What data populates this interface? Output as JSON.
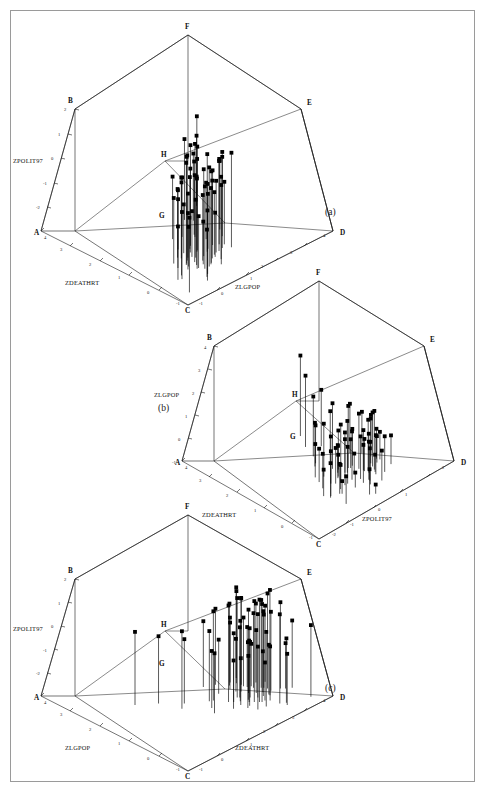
{
  "figure": {
    "border_color": "#9a9a9a",
    "background": "#ffffff",
    "caption_fragment": ""
  },
  "panels": [
    {
      "tag": "(a)",
      "corners": [
        "A",
        "B",
        "C",
        "D",
        "E",
        "F",
        "G",
        "H"
      ],
      "vertical_axis": {
        "title": "ZPOLIT97",
        "ticks": [
          "2",
          "1",
          "0",
          "-1",
          "-2"
        ]
      },
      "left_axis": {
        "title": "ZDEATHRT",
        "ticks": [
          "4",
          "3",
          "2",
          "1",
          "0",
          "-1"
        ]
      },
      "right_axis": {
        "title": "ZLGPOP",
        "ticks": [
          "-1",
          "0",
          "1",
          "2",
          "3",
          "4"
        ]
      }
    },
    {
      "tag": "(b)",
      "corners": [
        "A",
        "B",
        "C",
        "D",
        "E",
        "F",
        "G",
        "H"
      ],
      "vertical_axis": {
        "title": "ZLGPOP",
        "ticks": [
          "4",
          "3",
          "2",
          "1",
          "0",
          "-1"
        ]
      },
      "left_axis": {
        "title": "ZDEATHRT",
        "ticks": [
          "4",
          "3",
          "2",
          "1",
          "0",
          "-1"
        ]
      },
      "right_axis": {
        "title": "ZPOLIT97",
        "ticks": [
          "-2",
          "-1",
          "0",
          "1",
          "2"
        ]
      }
    },
    {
      "tag": "(c)",
      "corners": [
        "A",
        "B",
        "C",
        "D",
        "E",
        "F",
        "G",
        "H"
      ],
      "vertical_axis": {
        "title": "ZPOLIT97",
        "ticks": [
          "2",
          "1",
          "0",
          "-1",
          "-2"
        ]
      },
      "left_axis": {
        "title": "ZLGPOP",
        "ticks": [
          "4",
          "3",
          "2",
          "1",
          "0",
          "-1"
        ]
      },
      "right_axis": {
        "title": "ZDEATHRT",
        "ticks": [
          "4",
          "3",
          "2",
          "1",
          "0",
          "-1"
        ]
      }
    }
  ],
  "chart_data": {
    "type": "scatter",
    "title": "",
    "variables": [
      "ZDEATHRT",
      "ZLGPOP",
      "ZPOLIT97"
    ],
    "axis_ranges": {
      "ZDEATHRT": [
        -1,
        4
      ],
      "ZLGPOP": [
        -1,
        4
      ],
      "ZPOLIT97": [
        -2,
        2
      ]
    },
    "grid": false,
    "legend": null,
    "n_points": 62,
    "points": [
      [
        -0.55,
        -0.6,
        0.45
      ],
      [
        0.1,
        -0.35,
        0.2
      ],
      [
        -0.2,
        0.3,
        0.95
      ],
      [
        0.35,
        0.05,
        -0.15
      ],
      [
        0.6,
        -0.1,
        0.55
      ],
      [
        0.05,
        0.55,
        1.25
      ],
      [
        -0.3,
        0.2,
        -0.45
      ],
      [
        0.8,
        0.4,
        0.1
      ],
      [
        0.25,
        -0.25,
        1.05
      ],
      [
        1.1,
        0.7,
        0.35
      ],
      [
        0.45,
        0.15,
        -0.7
      ],
      [
        -0.1,
        0.85,
        0.6
      ],
      [
        0.7,
        0.3,
        1.45
      ],
      [
        0.15,
        -0.45,
        -0.25
      ],
      [
        0.95,
        0.6,
        0.75
      ],
      [
        0.4,
        1.0,
        0.05
      ],
      [
        -0.45,
        0.1,
        0.3
      ],
      [
        1.3,
        0.45,
        -0.35
      ],
      [
        0.55,
        0.75,
        0.85
      ],
      [
        0.2,
        0.25,
        1.6
      ],
      [
        0.85,
        -0.05,
        0.15
      ],
      [
        0.3,
        0.95,
        -0.55
      ],
      [
        1.55,
        1.2,
        0.4
      ],
      [
        0.05,
        0.4,
        0.7
      ],
      [
        0.65,
        0.55,
        -0.1
      ],
      [
        0.5,
        1.35,
        1.15
      ],
      [
        1.0,
        0.2,
        0.25
      ],
      [
        0.1,
        0.65,
        0.5
      ],
      [
        0.75,
        1.05,
        -0.2
      ],
      [
        0.35,
        0.35,
        0.9
      ],
      [
        1.2,
        0.8,
        1.3
      ],
      [
        0.6,
        1.5,
        0.05
      ],
      [
        0.25,
        0.5,
        -0.6
      ],
      [
        0.9,
        0.25,
        0.65
      ],
      [
        0.45,
        1.1,
        0.35
      ],
      [
        1.7,
        0.9,
        -0.05
      ],
      [
        0.15,
        0.7,
        1.0
      ],
      [
        0.8,
        1.25,
        0.45
      ],
      [
        0.55,
        0.15,
        1.35
      ],
      [
        2.1,
        1.6,
        0.2
      ],
      [
        0.3,
        0.85,
        0.55
      ],
      [
        1.05,
        0.45,
        -0.4
      ],
      [
        0.7,
        1.4,
        0.8
      ],
      [
        0.4,
        0.6,
        0.15
      ],
      [
        1.45,
        1.15,
        1.05
      ],
      [
        0.2,
        0.3,
        -0.3
      ],
      [
        0.95,
        1.7,
        0.6
      ],
      [
        0.65,
        0.95,
        1.2
      ],
      [
        2.6,
        2.1,
        0.3
      ],
      [
        0.5,
        0.4,
        0.85
      ],
      [
        1.15,
        1.3,
        -0.15
      ],
      [
        0.85,
        0.75,
        0.4
      ],
      [
        0.35,
        1.55,
        1.1
      ],
      [
        1.8,
        0.65,
        0.05
      ],
      [
        0.1,
        1.0,
        0.7
      ],
      [
        3.1,
        2.5,
        0.5
      ],
      [
        0.6,
        0.2,
        1.5
      ],
      [
        1.25,
        1.85,
        0.25
      ],
      [
        0.75,
        0.5,
        -0.5
      ],
      [
        0.45,
        1.2,
        0.95
      ],
      [
        2.3,
        1.45,
        0.65
      ],
      [
        0.9,
        0.8,
        1.4
      ]
    ]
  }
}
